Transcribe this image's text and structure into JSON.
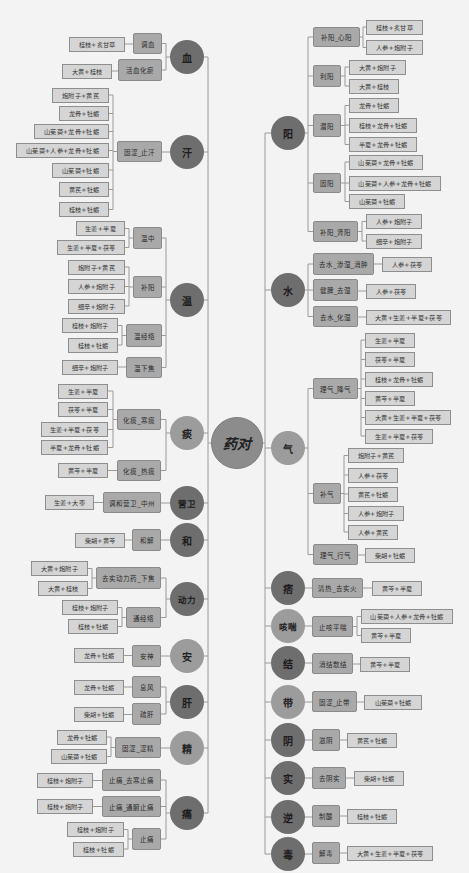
{
  "center": {
    "label": "药对"
  },
  "left": [
    {
      "label": "血",
      "tone": "dark",
      "groups": [
        {
          "label": "调血",
          "items": [
            "桂枝+炙甘草"
          ]
        },
        {
          "label": "活血化瘀",
          "items": [
            "大黄+桂枝"
          ]
        }
      ]
    },
    {
      "label": "汗",
      "tone": "dark",
      "groups": [
        {
          "label": "固涩_止汗",
          "items": [
            "炮附子+黄芪",
            "龙骨+牡蛎",
            "山茱萸+龙骨+牡蛎",
            "山茱萸+人参+龙骨+牡蛎",
            "山茱萸+牡蛎",
            "黄芪+牡蛎",
            "桂枝+牡蛎"
          ]
        }
      ]
    },
    {
      "label": "温",
      "tone": "dark",
      "groups": [
        {
          "label": "温中",
          "items": [
            "生姜+半夏",
            "生姜+半夏+茯苓"
          ]
        },
        {
          "label": "补阳",
          "items": [
            "炮附子+黄芪",
            "人参+炮附子",
            "细辛+炮附子"
          ]
        },
        {
          "label": "温经络",
          "items": [
            "桂枝+炮附子",
            "桂枝+牡蛎"
          ]
        },
        {
          "label": "温下焦",
          "items": [
            "细辛+炮附子"
          ]
        }
      ]
    },
    {
      "label": "痰",
      "tone": "light",
      "groups": [
        {
          "label": "化痰_寒痰",
          "items": [
            "生姜+半夏",
            "茯苓+半夏",
            "生姜+半夏+茯苓",
            "半夏+龙骨+牡蛎"
          ]
        },
        {
          "label": "化痰_热痰",
          "items": [
            "黄芩+半夏"
          ]
        }
      ]
    },
    {
      "label": "营卫",
      "tone": "dark",
      "groups": [
        {
          "label": "调和营卫_中州",
          "items": [
            "生姜+大枣"
          ]
        }
      ]
    },
    {
      "label": "和",
      "tone": "dark",
      "groups": [
        {
          "label": "和解",
          "items": [
            "柴胡+黄芩"
          ]
        }
      ]
    },
    {
      "label": "动力",
      "tone": "dark",
      "groups": [
        {
          "label": "去实动力药_下焦",
          "items": [
            "大黄+炮附子",
            "大黄+桂枝"
          ]
        },
        {
          "label": "通经络",
          "items": [
            "桂枝+炮附子",
            "桂枝+牡蛎"
          ]
        }
      ]
    },
    {
      "label": "安",
      "tone": "light",
      "groups": [
        {
          "label": "安神",
          "items": [
            "龙骨+牡蛎"
          ]
        }
      ]
    },
    {
      "label": "肝",
      "tone": "dark",
      "groups": [
        {
          "label": "息风",
          "items": [
            "龙骨+牡蛎"
          ]
        },
        {
          "label": "疏肝",
          "items": [
            "柴胡+牡蛎"
          ]
        }
      ]
    },
    {
      "label": "精",
      "tone": "light",
      "groups": [
        {
          "label": "固涩_涩精",
          "items": [
            "龙骨+牡蛎",
            "山茱萸+牡蛎"
          ]
        }
      ]
    },
    {
      "label": "痛",
      "tone": "dark",
      "groups": [
        {
          "label": "止痛_去寒止痛",
          "items": [
            "桂枝+炮附子"
          ]
        },
        {
          "label": "止痛_通腑止痛",
          "items": [
            "桂枝+炮附子"
          ]
        },
        {
          "label": "止痛",
          "items": [
            "桂枝+炮附子",
            "桂枝+牡蛎"
          ]
        }
      ]
    }
  ],
  "right": [
    {
      "label": "阳",
      "tone": "dark",
      "groups": [
        {
          "label": "补阳_心阳",
          "items": [
            "桂枝+炙甘草",
            "人参+炮附子"
          ]
        },
        {
          "label": "利阳",
          "items": [
            "大黄+炮附子",
            "大黄+桂枝"
          ]
        },
        {
          "label": "潜阳",
          "items": [
            "龙骨+牡蛎",
            "桂枝+龙骨+牡蛎",
            "半夏+龙骨+牡蛎"
          ]
        },
        {
          "label": "固阳",
          "items": [
            "山茱萸+龙骨+牡蛎",
            "山茱萸+人参+龙骨+牡蛎",
            "山茱萸+牡蛎"
          ]
        },
        {
          "label": "补阳_肾阳",
          "items": [
            "人参+炮附子",
            "细辛+炮附子"
          ]
        }
      ]
    },
    {
      "label": "水",
      "tone": "dark",
      "groups": [
        {
          "label": "去水_渗湿_消肿",
          "items": [
            "人参+茯苓"
          ]
        },
        {
          "label": "健脾_去湿",
          "items": [
            "人参+茯苓"
          ]
        },
        {
          "label": "去水_化湿",
          "items": [
            "大黄+生姜+半夏+茯苓"
          ]
        }
      ]
    },
    {
      "label": "气",
      "tone": "light",
      "groups": [
        {
          "label": "理气_降气",
          "items": [
            "生姜+半夏",
            "茯苓+半夏",
            "桂枝+龙骨+牡蛎",
            "黄芩+半夏",
            "大黄+生姜+半夏+茯苓",
            "生姜+半夏+茯苓"
          ]
        },
        {
          "label": "补气",
          "items": [
            "炮附子+黄芪",
            "人参+茯苓",
            "黄芪+牡蛎",
            "人参+炮附子",
            "人参+黄芪"
          ]
        },
        {
          "label": "理气_行气",
          "items": [
            "柴胡+牡蛎"
          ]
        }
      ]
    },
    {
      "label": "痞",
      "tone": "dark",
      "groups": [
        {
          "label": "清热_去实火",
          "items": [
            "黄芩+半夏"
          ]
        }
      ]
    },
    {
      "label": "咳喘",
      "tone": "light",
      "groups": [
        {
          "label": "止咳平喘",
          "items": [
            "山茱萸+人参+龙骨+牡蛎",
            "黄芩+半夏"
          ]
        }
      ]
    },
    {
      "label": "结",
      "tone": "dark",
      "groups": [
        {
          "label": "消结散结",
          "items": [
            "黄芩+半夏"
          ]
        }
      ]
    },
    {
      "label": "带",
      "tone": "light",
      "groups": [
        {
          "label": "固涩_止带",
          "items": [
            "山茱萸+牡蛎"
          ]
        }
      ]
    },
    {
      "label": "阴",
      "tone": "dark",
      "groups": [
        {
          "label": "滋阴",
          "items": [
            "黄芪+牡蛎"
          ]
        }
      ]
    },
    {
      "label": "实",
      "tone": "dark",
      "groups": [
        {
          "label": "去阴实",
          "items": [
            "柴胡+牡蛎"
          ]
        }
      ]
    },
    {
      "label": "逆",
      "tone": "dark",
      "groups": [
        {
          "label": "制酸",
          "items": [
            "桂枝+牡蛎"
          ]
        }
      ]
    },
    {
      "label": "毒",
      "tone": "dark",
      "groups": [
        {
          "label": "解毒",
          "items": [
            "大黄+生姜+半夏+茯苓"
          ]
        }
      ]
    }
  ],
  "colors": {
    "node_dark": "#6e6e6e",
    "node_light": "#9c9c9c",
    "center_node": "#8c8c8c",
    "function_box": "#a9a9a9",
    "herb_pair_box": "#d5d5d5",
    "connector_line": "#9a9a9a",
    "background": "#f3f3f3"
  }
}
